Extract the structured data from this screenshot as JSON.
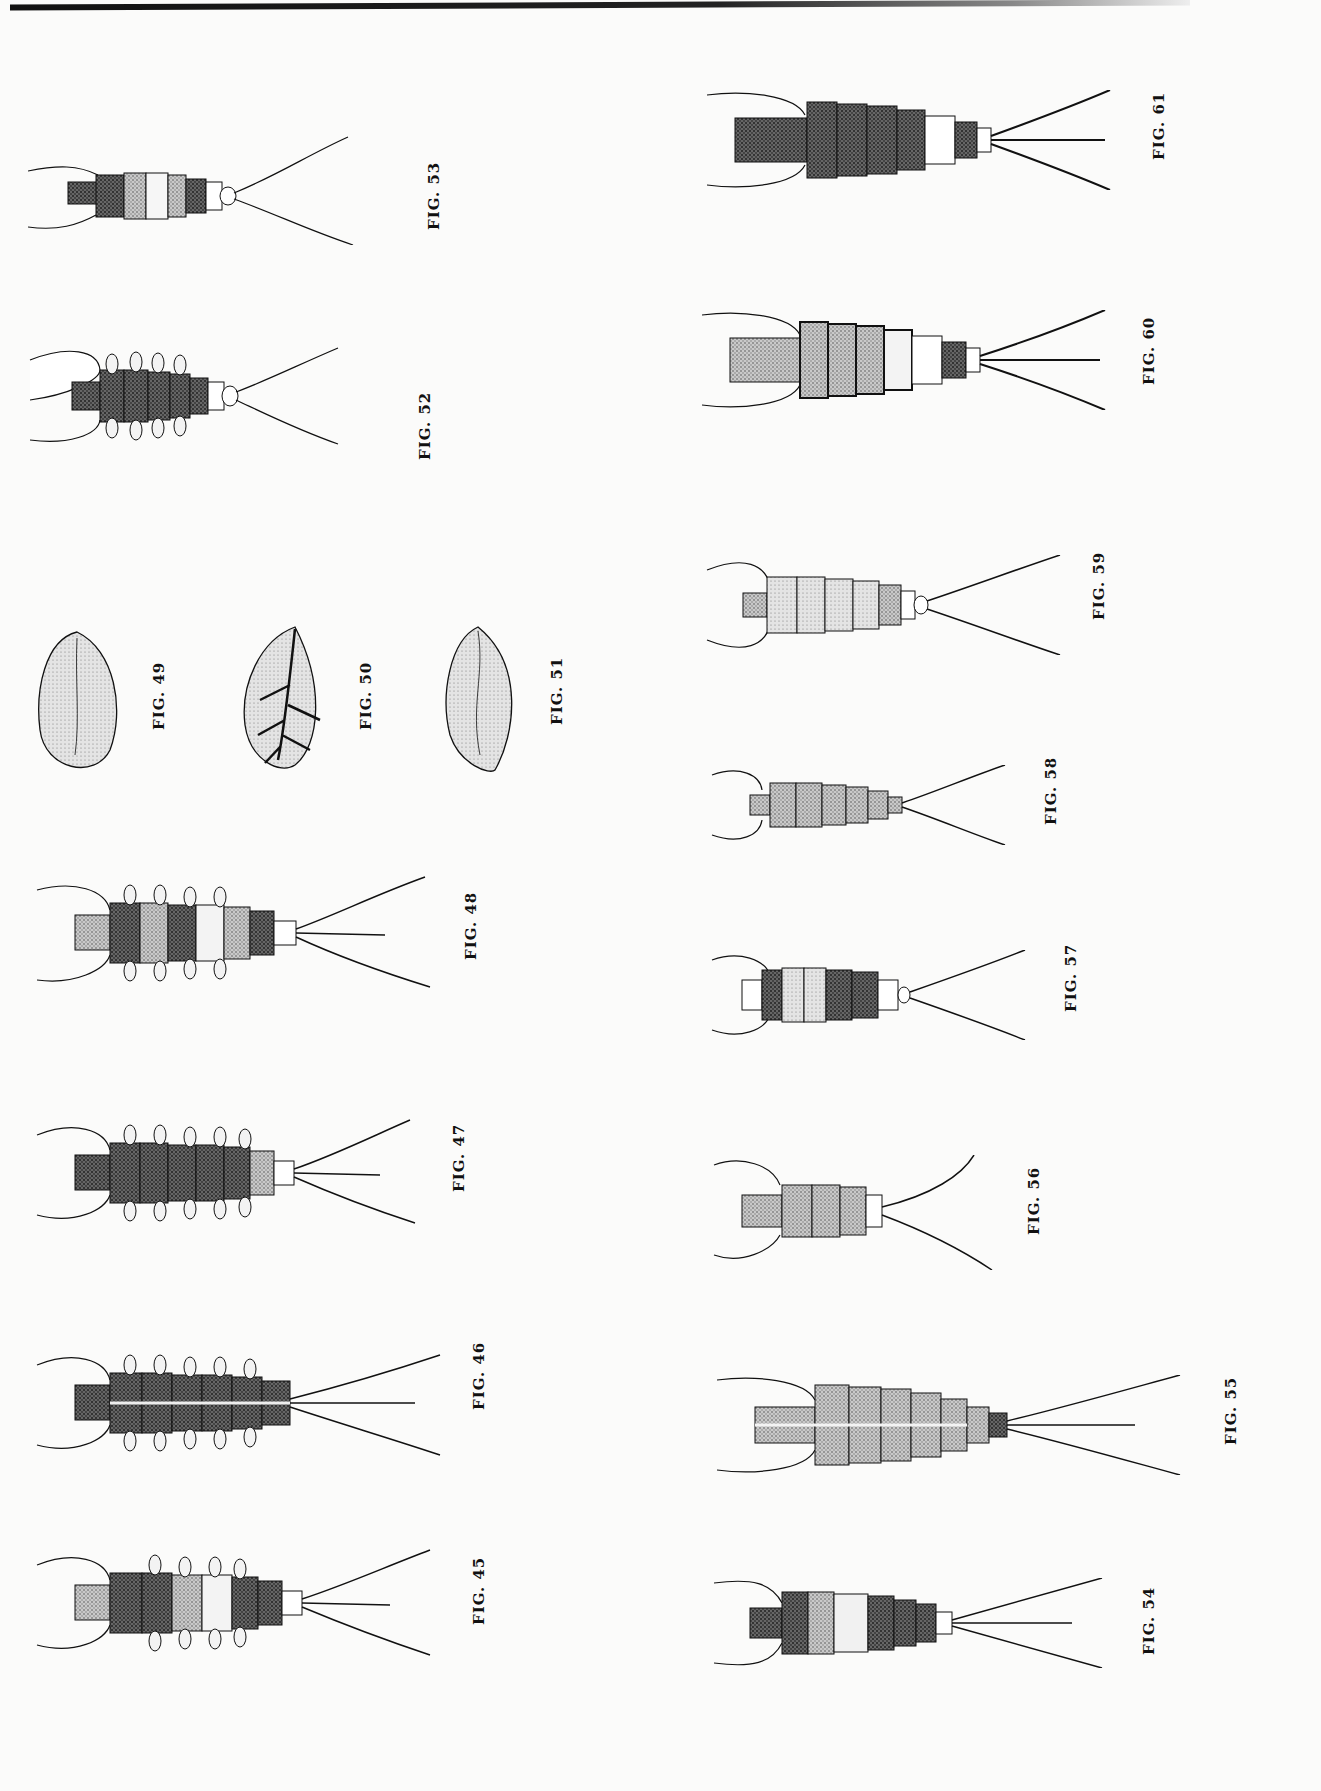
{
  "plate": {
    "figures": [
      {
        "id": "45",
        "label": "FIG. 45",
        "subject": "nymph",
        "tails": 3
      },
      {
        "id": "46",
        "label": "FIG. 46",
        "subject": "nymph",
        "tails": 3
      },
      {
        "id": "47",
        "label": "FIG. 47",
        "subject": "nymph",
        "tails": 3
      },
      {
        "id": "48",
        "label": "FIG. 48",
        "subject": "nymph",
        "tails": 3
      },
      {
        "id": "49",
        "label": "FIG. 49",
        "subject": "gill"
      },
      {
        "id": "50",
        "label": "FIG. 50",
        "subject": "gill (branched tracheae)"
      },
      {
        "id": "51",
        "label": "FIG. 51",
        "subject": "gill"
      },
      {
        "id": "52",
        "label": "FIG. 52",
        "subject": "nymph",
        "tails": 2
      },
      {
        "id": "53",
        "label": "FIG. 53",
        "subject": "nymph",
        "tails": 2
      },
      {
        "id": "54",
        "label": "FIG. 54",
        "subject": "nymph",
        "tails": 3
      },
      {
        "id": "55",
        "label": "FIG. 55",
        "subject": "nymph",
        "tails": 3
      },
      {
        "id": "56",
        "label": "FIG. 56",
        "subject": "nymph",
        "tails": 2
      },
      {
        "id": "57",
        "label": "FIG. 57",
        "subject": "nymph",
        "tails": 2
      },
      {
        "id": "58",
        "label": "FIG. 58",
        "subject": "nymph",
        "tails": 2
      },
      {
        "id": "59",
        "label": "FIG. 59",
        "subject": "nymph",
        "tails": 2
      },
      {
        "id": "60",
        "label": "FIG. 60",
        "subject": "nymph",
        "tails": 3
      },
      {
        "id": "61",
        "label": "FIG. 61",
        "subject": "nymph",
        "tails": 3
      }
    ]
  },
  "colors": {
    "ink": "#111111",
    "paper": "#fbfbfa",
    "stipple": "#6a6a6a",
    "dark_stipple": "#333333"
  }
}
